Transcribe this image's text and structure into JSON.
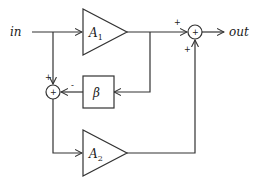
{
  "diagram": {
    "input_label": "in",
    "output_label": "out",
    "blocks": {
      "amp1": {
        "label": "A",
        "subscript": "1"
      },
      "amp2": {
        "label": "A",
        "subscript": "2"
      },
      "feedback": {
        "label": "β"
      }
    },
    "junctions": {
      "left": {
        "symbol": "+",
        "in_top_sign": "+",
        "in_right_sign": "-"
      },
      "right": {
        "symbol": "+",
        "in_left_sign": "+",
        "in_bottom_sign": "+"
      }
    },
    "colors": {
      "stroke": "#333333",
      "background": "#ffffff"
    }
  }
}
